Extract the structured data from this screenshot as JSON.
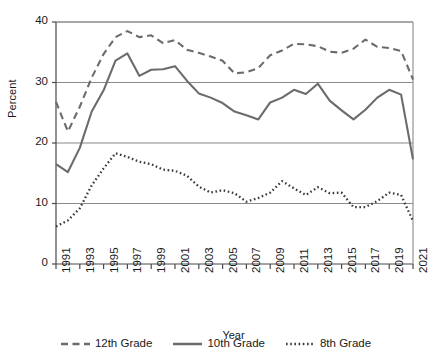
{
  "chart_data": {
    "type": "line",
    "title": "",
    "xlabel": "Year",
    "ylabel": "Percent",
    "ylim": [
      0,
      40
    ],
    "yticks": [
      0,
      10,
      20,
      30,
      40
    ],
    "xlim": [
      1991,
      2021
    ],
    "xticks": [
      1991,
      1993,
      1995,
      1997,
      1999,
      2001,
      2003,
      2005,
      2007,
      2009,
      2011,
      2013,
      2015,
      2017,
      2019,
      2021
    ],
    "grid": "horizontal",
    "legend_position": "bottom",
    "x": [
      1991,
      1992,
      1993,
      1994,
      1995,
      1996,
      1997,
      1998,
      1999,
      2000,
      2001,
      2002,
      2003,
      2004,
      2005,
      2006,
      2007,
      2008,
      2009,
      2010,
      2011,
      2012,
      2013,
      2014,
      2015,
      2016,
      2017,
      2018,
      2019,
      2020,
      2021
    ],
    "series": [
      {
        "name": "12th Grade",
        "style": "dashed",
        "color": "#6b6b6b",
        "values": [
          26.8,
          21.9,
          26.0,
          30.8,
          34.7,
          37.5,
          38.5,
          37.5,
          37.8,
          36.5,
          37.0,
          35.4,
          34.9,
          34.3,
          33.6,
          31.5,
          31.7,
          32.4,
          34.5,
          35.3,
          36.4,
          36.3,
          36.0,
          35.1,
          34.9,
          35.6,
          37.1,
          35.9,
          35.7,
          35.2,
          30.5
        ]
      },
      {
        "name": "10th Grade",
        "style": "solid",
        "color": "#6b6b6b",
        "values": [
          16.5,
          15.2,
          19.2,
          25.2,
          28.7,
          33.6,
          34.8,
          31.1,
          32.1,
          32.2,
          32.7,
          30.3,
          28.2,
          27.5,
          26.6,
          25.2,
          24.6,
          23.9,
          26.7,
          27.5,
          28.8,
          28.1,
          29.8,
          27.0,
          25.4,
          23.9,
          25.5,
          27.5,
          28.8,
          28.0,
          17.3
        ]
      },
      {
        "name": "8th Grade",
        "style": "dotted",
        "color": "#3a3a3a",
        "values": [
          6.2,
          7.2,
          9.2,
          13.0,
          15.8,
          18.3,
          17.7,
          16.9,
          16.5,
          15.6,
          15.4,
          14.6,
          12.8,
          11.8,
          12.2,
          11.7,
          10.3,
          10.9,
          11.8,
          13.7,
          12.5,
          11.4,
          12.7,
          11.7,
          11.8,
          9.4,
          9.4,
          10.4,
          11.8,
          11.4,
          7.1
        ]
      }
    ]
  },
  "axis": {
    "y_title": "Percent",
    "x_title": "Year",
    "y_tick_labels": [
      "0",
      "10",
      "20",
      "30",
      "40"
    ],
    "x_tick_labels": [
      "1991",
      "1993",
      "1995",
      "1997",
      "1999",
      "2001",
      "2003",
      "2005",
      "2007",
      "2009",
      "2011",
      "2013",
      "2015",
      "2017",
      "2019",
      "2021"
    ]
  },
  "legend": {
    "items": [
      {
        "label": "12th Grade",
        "style": "dashed"
      },
      {
        "label": "10th Grade",
        "style": "solid"
      },
      {
        "label": "8th Grade",
        "style": "dotted"
      }
    ]
  },
  "colors": {
    "series_gray": "#6b6b6b",
    "series_dark": "#3a3a3a",
    "grid": "#8a8a8a",
    "axis": "#555555",
    "background": "#ffffff"
  }
}
